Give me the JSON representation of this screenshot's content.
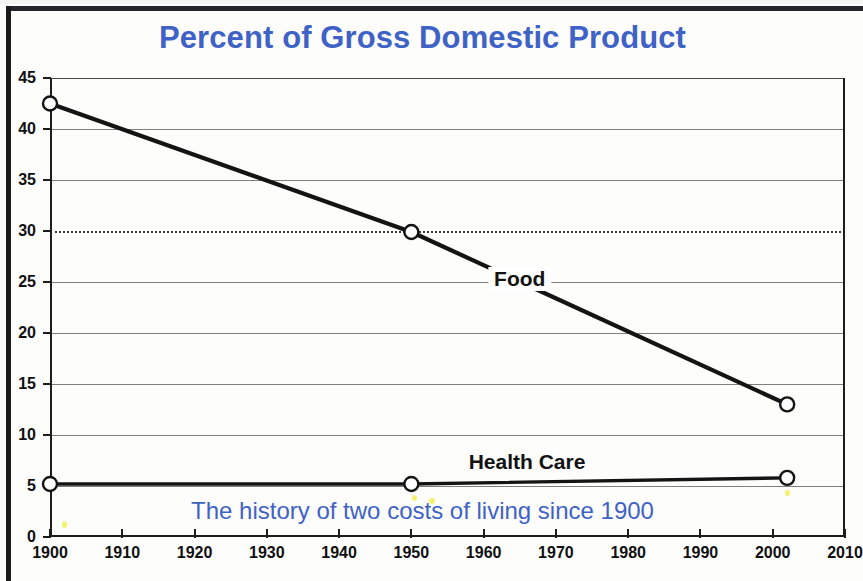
{
  "title": "Percent of Gross Domestic Product",
  "subtitle": "The history of two costs of living since 1900",
  "colors": {
    "title_blue": "#3f62c6",
    "subtitle_blue": "#3f62c6",
    "line_black": "#141414",
    "gridline_gray": "#7f7f7f",
    "artifact_yellow": "#f2ee55"
  },
  "chart_data": {
    "type": "line",
    "title": "Percent of Gross Domestic Product",
    "subtitle": "The history of two costs of living since 1900",
    "xlabel": "",
    "ylabel": "",
    "xlim": [
      1900,
      2010
    ],
    "ylim": [
      0,
      45
    ],
    "xticks": [
      1900,
      1910,
      1920,
      1930,
      1940,
      1950,
      1960,
      1970,
      1980,
      1990,
      2000,
      2010
    ],
    "yticks": [
      0,
      5,
      10,
      15,
      20,
      25,
      30,
      35,
      40,
      45
    ],
    "grid": true,
    "grid_note": "horizontal gridlines at every y tick; the line at y=30 is dotted, the rest are solid gray",
    "legend": "inline series labels on the plot",
    "series": [
      {
        "name": "Food",
        "marker": "open-circle",
        "x": [
          1900,
          1950,
          2002
        ],
        "values": [
          42.5,
          29.9,
          13.0
        ]
      },
      {
        "name": "Health Care",
        "marker": "open-circle",
        "x": [
          1900,
          1950,
          2002
        ],
        "values": [
          5.2,
          5.2,
          5.8
        ]
      }
    ],
    "annotations": [
      {
        "text": "Food",
        "x": 1965,
        "y": 25.3
      },
      {
        "text": "Health Care",
        "x": 1966,
        "y": 7.4
      }
    ]
  }
}
